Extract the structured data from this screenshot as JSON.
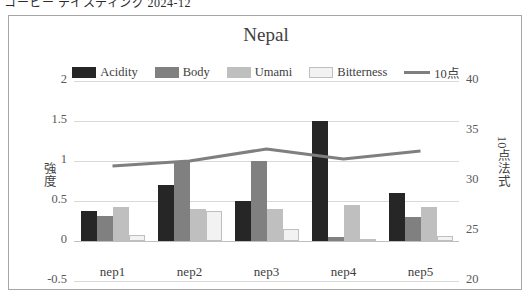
{
  "top_strip": {
    "text": "コーヒー テイスティング 2024-12"
  },
  "chart": {
    "title": "Nepal",
    "legend": [
      {
        "label": "Acidity",
        "type": "swatch",
        "color": "#262626",
        "border": "#262626"
      },
      {
        "label": "Body",
        "type": "swatch",
        "color": "#808080",
        "border": "#808080"
      },
      {
        "label": "Umami",
        "type": "swatch",
        "color": "#bfbfbf",
        "border": "#bfbfbf"
      },
      {
        "label": "Bitterness",
        "type": "swatch",
        "color": "#f2f2f2",
        "border": "#bfbfbf"
      },
      {
        "label": "10点",
        "type": "line",
        "color": "#7f7f7f",
        "border": "#7f7f7f"
      }
    ],
    "left_axis": {
      "title": "強度",
      "ticks": [
        "2",
        "1.5",
        "1",
        "0.5",
        "0",
        "-0.5"
      ]
    },
    "right_axis": {
      "title": "10点法式",
      "ticks": [
        "40",
        "35",
        "30",
        "25",
        "20"
      ]
    }
  },
  "chart_data": {
    "type": "bar",
    "title": "Nepal",
    "xlabel": "",
    "ylabel": "強度",
    "y2label": "10点法式",
    "categories": [
      "nep1",
      "nep2",
      "nep3",
      "nep4",
      "nep5"
    ],
    "ylim": [
      -0.5,
      2
    ],
    "yticks": [
      -0.5,
      0,
      0.5,
      1,
      1.5,
      2
    ],
    "y2lim": [
      20,
      40
    ],
    "y2ticks": [
      20,
      25,
      30,
      35,
      40
    ],
    "grid": true,
    "legend_position": "top",
    "series": [
      {
        "name": "Acidity",
        "type": "bar",
        "axis": "left",
        "color": "#262626",
        "values": [
          0.37,
          0.7,
          0.5,
          1.5,
          0.6
        ]
      },
      {
        "name": "Body",
        "type": "bar",
        "axis": "left",
        "color": "#808080",
        "values": [
          0.31,
          1.0,
          1.0,
          0.05,
          0.3
        ]
      },
      {
        "name": "Umami",
        "type": "bar",
        "axis": "left",
        "color": "#bfbfbf",
        "values": [
          0.42,
          0.4,
          0.4,
          0.45,
          0.43
        ]
      },
      {
        "name": "Bitterness",
        "type": "bar",
        "axis": "left",
        "color": "#f2f2f2",
        "values": [
          0.07,
          0.37,
          0.15,
          0.02,
          0.06
        ]
      },
      {
        "name": "10点",
        "type": "line",
        "axis": "right",
        "color": "#7f7f7f",
        "values": [
          31.5,
          32.0,
          33.2,
          32.2,
          33.0
        ]
      }
    ]
  }
}
